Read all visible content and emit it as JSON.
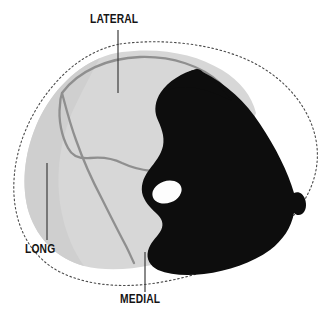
{
  "figure": {
    "type": "anatomical-cross-section-diagram",
    "background_color": "#ffffff",
    "colors": {
      "background": "#ffffff",
      "light_tissue": "#d7d7d7",
      "light_tissue_shade": "#c9c9c9",
      "internal_contour": "#8f8f8f",
      "dark_tissue": "#0d0d0d",
      "white_oval": "#fdfdfd",
      "outer_dotted_contour": "#4a4a4a",
      "label_text": "#141414",
      "leader_line": "#3c3c3c"
    },
    "labels": [
      {
        "id": "lateral",
        "text": "LATERAL",
        "x": 90,
        "y": 13,
        "leader": {
          "x1": 118,
          "y1": 30,
          "x2": 118,
          "y2": 93
        }
      },
      {
        "id": "long",
        "text": "LONG",
        "x": 25,
        "y": 243,
        "leader": {
          "x1": 47,
          "y1": 163,
          "x2": 47,
          "y2": 240
        }
      },
      {
        "id": "medial",
        "text": "MEDIAL",
        "x": 120,
        "y": 293,
        "leader": {
          "x1": 145,
          "y1": 252,
          "x2": 145,
          "y2": 292
        }
      }
    ],
    "regions": [
      {
        "id": "light-tissue-mass",
        "fill": "#d7d7d7",
        "label_ref": "lateral"
      },
      {
        "id": "upper-lobe-contour",
        "stroke": "#8f8f8f"
      },
      {
        "id": "septum-contour",
        "stroke": "#8f8f8f",
        "label_ref": "long"
      },
      {
        "id": "dark-tissue-mass",
        "fill": "#0d0d0d",
        "label_ref": "medial"
      },
      {
        "id": "oval-opening",
        "fill": "#fdfdfd",
        "cx": 167,
        "cy": 192,
        "rx": 15,
        "ry": 11,
        "rotation": -20
      },
      {
        "id": "outer-boundary",
        "stroke": "#4a4a4a",
        "style": "dotted"
      }
    ]
  }
}
